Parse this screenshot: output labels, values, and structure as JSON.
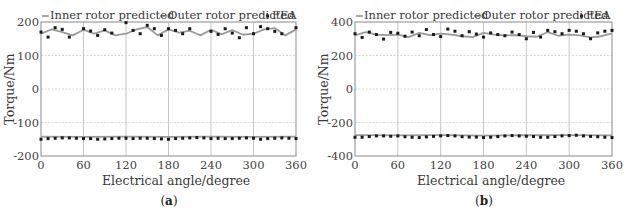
{
  "chart_data": [
    {
      "type": "line",
      "panel_label": "(a)",
      "panel_letter": "a",
      "title": "",
      "xlabel": "Electrical angle/degree",
      "ylabel": "Torque/Nm",
      "xlim": [
        0,
        360
      ],
      "ylim": [
        -200,
        200
      ],
      "xticks": [
        0,
        60,
        120,
        180,
        240,
        300,
        360
      ],
      "yticks": [
        -200,
        -100,
        0,
        100,
        200
      ],
      "grid": true,
      "legend": {
        "position": "top",
        "entries": [
          "Inner rotor predicted",
          "Outer rotor predicted",
          "FEA"
        ]
      },
      "series": [
        {
          "name": "Outer rotor predicted",
          "kind": "line",
          "color": "#9a9a9a",
          "x": [
            0,
            15,
            30,
            45,
            60,
            75,
            90,
            105,
            120,
            135,
            150,
            165,
            180,
            195,
            210,
            225,
            240,
            255,
            270,
            285,
            300,
            315,
            330,
            345,
            360
          ],
          "y": [
            165,
            178,
            170,
            160,
            177,
            165,
            175,
            160,
            165,
            178,
            185,
            160,
            178,
            168,
            174,
            160,
            177,
            163,
            176,
            162,
            165,
            178,
            182,
            160,
            178
          ]
        },
        {
          "name": "Inner rotor predicted",
          "kind": "line",
          "color": "#9a9a9a",
          "x": [
            0,
            60,
            120,
            180,
            240,
            300,
            360
          ],
          "y": [
            -142,
            -143,
            -142,
            -143,
            -142,
            -143,
            -142
          ]
        },
        {
          "name": "FEA (outer)",
          "kind": "scatter",
          "color": "#1a1a1a",
          "x": [
            0,
            10,
            20,
            30,
            40,
            60,
            70,
            80,
            90,
            100,
            120,
            130,
            140,
            150,
            160,
            170,
            180,
            190,
            200,
            210,
            240,
            250,
            260,
            270,
            280,
            290,
            300,
            310,
            320,
            330,
            340,
            360
          ],
          "y": [
            170,
            155,
            183,
            178,
            155,
            180,
            173,
            160,
            177,
            167,
            198,
            175,
            165,
            190,
            180,
            160,
            180,
            175,
            165,
            180,
            172,
            163,
            180,
            167,
            153,
            183,
            165,
            186,
            180,
            172,
            165,
            183
          ]
        },
        {
          "name": "FEA (inner)",
          "kind": "scatter",
          "color": "#1a1a1a",
          "x": [
            0,
            10,
            20,
            30,
            40,
            50,
            60,
            70,
            80,
            90,
            100,
            110,
            120,
            130,
            140,
            150,
            160,
            170,
            180,
            190,
            200,
            210,
            220,
            230,
            240,
            250,
            260,
            270,
            280,
            290,
            300,
            310,
            320,
            330,
            340,
            350,
            360
          ],
          "y": [
            -150,
            -148,
            -147,
            -146,
            -146,
            -147,
            -148,
            -148,
            -150,
            -149,
            -148,
            -147,
            -147,
            -148,
            -147,
            -147,
            -148,
            -149,
            -150,
            -148,
            -147,
            -146,
            -145,
            -146,
            -148,
            -147,
            -148,
            -148,
            -147,
            -146,
            -147,
            -150,
            -148,
            -147,
            -146,
            -147,
            -148
          ]
        }
      ]
    },
    {
      "type": "line",
      "panel_label": "(b)",
      "panel_letter": "b",
      "title": "",
      "xlabel": "Electrical angle/degree",
      "ylabel": "Torque/Nm",
      "xlim": [
        0,
        360
      ],
      "ylim": [
        -400,
        400
      ],
      "xticks": [
        0,
        60,
        120,
        180,
        240,
        300,
        360
      ],
      "yticks": [
        -400,
        -200,
        0,
        200,
        400
      ],
      "grid": true,
      "legend": {
        "position": "top",
        "entries": [
          "Inner rotor predicted",
          "Outer rotor predicted",
          "FEA"
        ]
      },
      "series": [
        {
          "name": "Outer rotor predicted",
          "kind": "line",
          "color": "#9a9a9a",
          "x": [
            0,
            15,
            30,
            45,
            60,
            75,
            90,
            105,
            120,
            135,
            150,
            165,
            180,
            195,
            210,
            225,
            240,
            255,
            270,
            285,
            300,
            315,
            330,
            345,
            360
          ],
          "y": [
            320,
            340,
            325,
            322,
            325,
            310,
            335,
            322,
            330,
            325,
            315,
            310,
            335,
            325,
            320,
            322,
            315,
            312,
            340,
            318,
            325,
            320,
            308,
            315,
            332
          ]
        },
        {
          "name": "Inner rotor predicted",
          "kind": "line",
          "color": "#9a9a9a",
          "x": [
            0,
            60,
            120,
            180,
            240,
            300,
            360
          ],
          "y": [
            -275,
            -277,
            -275,
            -278,
            -276,
            -275,
            -277
          ]
        },
        {
          "name": "FEA (outer)",
          "kind": "scatter",
          "color": "#1a1a1a",
          "x": [
            0,
            10,
            20,
            30,
            40,
            50,
            60,
            70,
            80,
            90,
            100,
            110,
            120,
            130,
            140,
            150,
            160,
            170,
            180,
            190,
            200,
            210,
            220,
            230,
            240,
            250,
            260,
            270,
            280,
            290,
            300,
            310,
            320,
            330,
            340,
            350,
            360
          ],
          "y": [
            330,
            308,
            340,
            325,
            298,
            338,
            333,
            315,
            340,
            318,
            355,
            325,
            313,
            358,
            345,
            318,
            342,
            328,
            310,
            335,
            325,
            318,
            340,
            325,
            300,
            338,
            310,
            350,
            342,
            330,
            350,
            345,
            330,
            300,
            335,
            345,
            350
          ]
        },
        {
          "name": "FEA (inner)",
          "kind": "scatter",
          "color": "#1a1a1a",
          "x": [
            0,
            10,
            20,
            30,
            40,
            50,
            60,
            70,
            80,
            90,
            100,
            110,
            120,
            130,
            140,
            150,
            160,
            170,
            180,
            190,
            200,
            210,
            220,
            230,
            240,
            250,
            260,
            270,
            280,
            290,
            300,
            310,
            320,
            330,
            340,
            350,
            360
          ],
          "y": [
            -288,
            -288,
            -284,
            -280,
            -280,
            -282,
            -280,
            -285,
            -288,
            -290,
            -286,
            -283,
            -280,
            -278,
            -280,
            -285,
            -287,
            -287,
            -290,
            -288,
            -284,
            -280,
            -278,
            -280,
            -282,
            -284,
            -288,
            -288,
            -284,
            -280,
            -278,
            -276,
            -280,
            -283,
            -285,
            -288,
            -290
          ]
        }
      ]
    }
  ]
}
